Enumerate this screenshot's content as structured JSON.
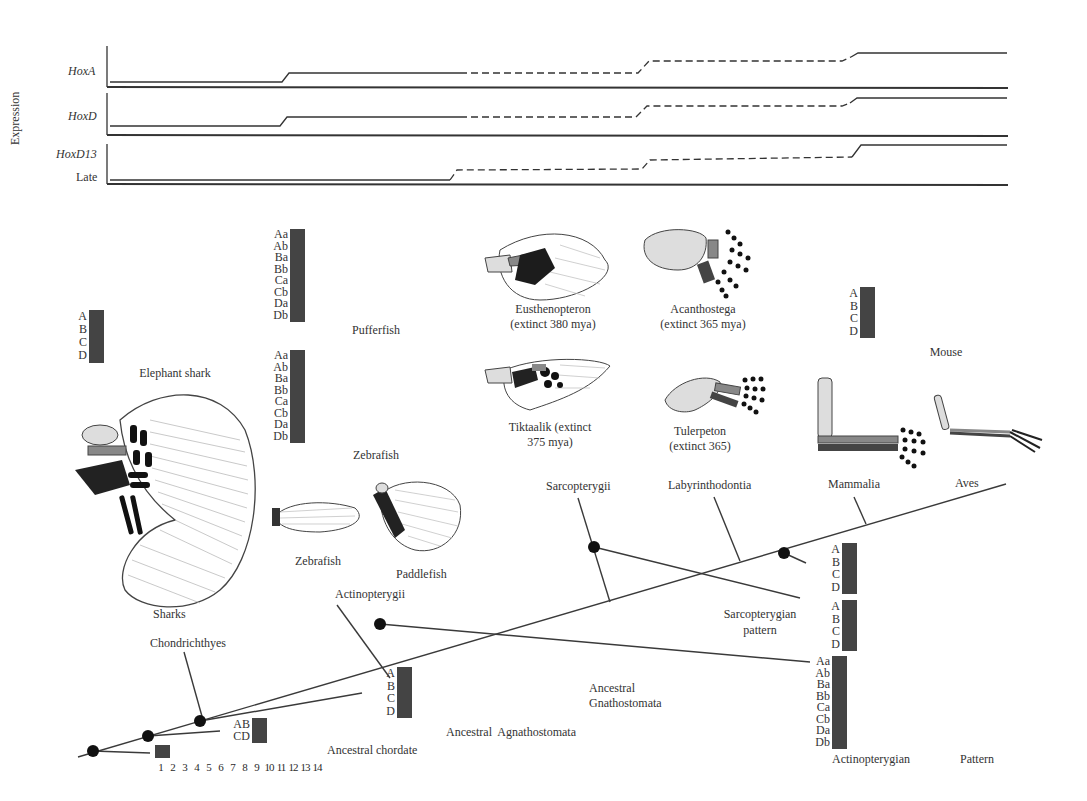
{
  "expression_panel": {
    "y_axis_label": "Expression",
    "tracks": [
      {
        "label": "HoxA",
        "italic": true
      },
      {
        "label": "HoxD",
        "italic": true
      },
      {
        "label": "HoxD13",
        "italic": true,
        "sublabel": "Late"
      }
    ]
  },
  "shade_colors": [
    "#ffffff",
    "#dcdcdc",
    "#999999",
    "#555555",
    "#1c1c1c"
  ],
  "grids": {
    "elephant_shark": {
      "caption": "Elephant shark",
      "rows": [
        "A",
        "B",
        "C",
        "D"
      ],
      "cells": [
        [
          3,
          4,
          4,
          1,
          4,
          2,
          3,
          0,
          2,
          1,
          3,
          0,
          3,
          0
        ],
        [
          3,
          4,
          4,
          1,
          4,
          2,
          3,
          3,
          2,
          1,
          0,
          0,
          3,
          0
        ],
        [
          3,
          0,
          4,
          1,
          4,
          2,
          0,
          3,
          2,
          1,
          3,
          2,
          3,
          0
        ],
        [
          3,
          0,
          4,
          0,
          4,
          0,
          0,
          3,
          2,
          1,
          3,
          2,
          2,
          1
        ]
      ]
    },
    "pufferfish": {
      "caption": "Pufferfish",
      "rows": [
        "Aa",
        "Ab",
        "Ba",
        "Bb",
        "Ca",
        "Cb",
        "Da",
        "Db"
      ],
      "cells": [
        [
          3,
          4,
          4,
          1,
          4,
          0,
          0,
          0,
          2,
          1,
          3,
          0,
          2,
          0
        ],
        [
          0,
          4,
          0,
          0,
          0,
          0,
          0,
          0,
          2,
          1,
          3,
          0,
          2,
          0
        ],
        [
          3,
          4,
          4,
          1,
          4,
          2,
          0,
          3,
          2,
          0,
          0,
          0,
          2,
          0
        ],
        [
          3,
          0,
          4,
          0,
          4,
          2,
          0,
          0,
          0,
          0,
          0,
          0,
          0,
          0
        ],
        [
          0,
          0,
          0,
          1,
          4,
          2,
          0,
          3,
          2,
          1,
          3,
          2,
          2,
          0
        ],
        [
          0,
          0,
          0,
          0,
          0,
          0,
          0,
          0,
          0,
          0,
          0,
          0,
          0,
          0
        ],
        [
          0,
          0,
          4,
          1,
          0,
          0,
          0,
          0,
          2,
          1,
          3,
          2,
          0,
          0
        ],
        [
          0,
          0,
          0,
          1,
          0,
          0,
          0,
          0,
          2,
          0,
          3,
          0,
          0,
          0
        ]
      ]
    },
    "zebrafish": {
      "caption": "Zebrafish",
      "rows": [
        "Aa",
        "Ab",
        "Ba",
        "Bb",
        "Ca",
        "Cb",
        "Da",
        "Db"
      ],
      "cells": [
        [
          3,
          0,
          4,
          1,
          4,
          0,
          0,
          0,
          2,
          1,
          3,
          0,
          2,
          0
        ],
        [
          0,
          4,
          0,
          0,
          0,
          0,
          0,
          0,
          2,
          1,
          3,
          0,
          2,
          0
        ],
        [
          3,
          4,
          4,
          1,
          4,
          2,
          3,
          3,
          2,
          1,
          0,
          0,
          0,
          0
        ],
        [
          3,
          0,
          0,
          0,
          4,
          2,
          0,
          3,
          0,
          0,
          0,
          0,
          0,
          0
        ],
        [
          3,
          0,
          4,
          1,
          4,
          0,
          3,
          3,
          2,
          1,
          3,
          0,
          2,
          0
        ],
        [
          0,
          0,
          0,
          0,
          0,
          2,
          0,
          0,
          0,
          0,
          3,
          2,
          2,
          0
        ],
        [
          0,
          0,
          4,
          1,
          0,
          0,
          0,
          3,
          2,
          1,
          3,
          2,
          2,
          0
        ],
        [
          0,
          0,
          0,
          0,
          0,
          0,
          0,
          0,
          0,
          0,
          0,
          0,
          0,
          0
        ]
      ]
    },
    "mouse": {
      "caption": "Mouse",
      "rows": [
        "A",
        "B",
        "C",
        "D"
      ],
      "cells": [
        [
          3,
          4,
          4,
          1,
          4,
          2,
          3,
          0,
          2,
          1,
          3,
          0,
          3,
          0
        ],
        [
          3,
          4,
          4,
          1,
          4,
          2,
          3,
          3,
          2,
          0,
          0,
          0,
          2,
          0
        ],
        [
          0,
          0,
          0,
          1,
          4,
          2,
          3,
          0,
          2,
          1,
          3,
          3,
          2,
          0
        ],
        [
          3,
          0,
          4,
          1,
          0,
          0,
          0,
          3,
          2,
          1,
          3,
          2,
          2,
          0
        ]
      ]
    },
    "ancestral_gnathostomata": {
      "caption": "Ancestral Gnathostomata",
      "rows": [
        "A",
        "B",
        "C",
        "D"
      ],
      "cells": [
        [
          3,
          4,
          4,
          1,
          4,
          2,
          3,
          0,
          2,
          1,
          3,
          0,
          3,
          1
        ],
        [
          3,
          4,
          4,
          1,
          4,
          2,
          3,
          3,
          2,
          1,
          0,
          0,
          3,
          1
        ],
        [
          3,
          0,
          4,
          1,
          4,
          2,
          0,
          3,
          2,
          1,
          3,
          3,
          3,
          0
        ],
        [
          3,
          4,
          4,
          1,
          4,
          0,
          0,
          3,
          2,
          1,
          3,
          3,
          3,
          1
        ]
      ]
    },
    "ancestral_agnathostomata": {
      "caption": "Ancestral  Agnathostomata",
      "rows": [
        "AB",
        "CD"
      ],
      "cells": [
        [
          3,
          4,
          4,
          1,
          4,
          2,
          3,
          3,
          2,
          1,
          3,
          0,
          2,
          1
        ],
        [
          3,
          0,
          4,
          1,
          4,
          2,
          0,
          3,
          2,
          1,
          3,
          3,
          2,
          1
        ]
      ]
    },
    "ancestral_chordate": {
      "caption": "Ancestral chordate",
      "cells": [
        [
          3,
          4,
          4,
          1,
          4,
          2,
          3,
          3,
          2,
          1,
          3,
          3,
          2,
          1
        ]
      ],
      "column_numbers": [
        "1",
        "2",
        "3",
        "4",
        "5",
        "6",
        "7",
        "8",
        "9",
        "10",
        "11",
        "12",
        "13",
        "14"
      ]
    },
    "tetrapod_pattern": {
      "rows": [
        "A",
        "B",
        "C",
        "D"
      ],
      "cells": [
        [
          3,
          4,
          4,
          1,
          4,
          2,
          3,
          0,
          2,
          1,
          3,
          0,
          3,
          0
        ],
        [
          3,
          4,
          4,
          1,
          4,
          2,
          3,
          3,
          2,
          0,
          0,
          0,
          2,
          0
        ],
        [
          0,
          0,
          0,
          1,
          4,
          2,
          3,
          0,
          2,
          1,
          3,
          3,
          2,
          0
        ],
        [
          3,
          0,
          4,
          1,
          0,
          0,
          0,
          3,
          2,
          1,
          3,
          3,
          2,
          0
        ]
      ]
    },
    "sarcopterygian_pattern": {
      "caption": "Sarcopterygian pattern",
      "rows": [
        "A",
        "B",
        "C",
        "D"
      ],
      "cells": [
        [
          3,
          4,
          4,
          1,
          4,
          0,
          0,
          0,
          2,
          1,
          3,
          0,
          3,
          1
        ],
        [
          3,
          4,
          4,
          1,
          4,
          2,
          3,
          3,
          2,
          1,
          0,
          0,
          2,
          0
        ],
        [
          3,
          0,
          4,
          1,
          4,
          2,
          0,
          3,
          2,
          1,
          3,
          3,
          2,
          0
        ],
        [
          0,
          0,
          4,
          1,
          0,
          0,
          0,
          3,
          2,
          1,
          3,
          3,
          2,
          0
        ]
      ]
    },
    "actinopterygian_pattern": {
      "caption_left": "Actinopterygian",
      "caption_right": "Pattern",
      "rows": [
        "Aa",
        "Ab",
        "Ba",
        "Bb",
        "Ca",
        "Cb",
        "Da",
        "Db"
      ],
      "cells": [
        [
          3,
          4,
          4,
          1,
          4,
          0,
          0,
          0,
          2,
          1,
          3,
          0,
          2,
          0
        ],
        [
          0,
          4,
          0,
          0,
          0,
          0,
          0,
          0,
          2,
          1,
          3,
          0,
          2,
          0
        ],
        [
          3,
          4,
          4,
          1,
          4,
          2,
          3,
          3,
          2,
          1,
          0,
          0,
          0,
          0
        ],
        [
          3,
          0,
          0,
          0,
          4,
          2,
          0,
          3,
          0,
          0,
          0,
          0,
          0,
          0
        ],
        [
          3,
          0,
          4,
          1,
          4,
          0,
          2,
          3,
          2,
          1,
          3,
          3,
          2,
          0
        ],
        [
          0,
          0,
          0,
          0,
          0,
          2,
          0,
          0,
          0,
          0,
          3,
          3,
          2,
          0
        ],
        [
          0,
          0,
          4,
          1,
          0,
          0,
          0,
          3,
          2,
          1,
          3,
          3,
          2,
          0
        ],
        [
          0,
          0,
          4,
          1,
          0,
          0,
          0,
          3,
          2,
          1,
          3,
          3,
          2,
          0
        ]
      ]
    }
  },
  "specimens": {
    "eusthenopteron": {
      "line1": "Eusthenopteron",
      "line2": "(extinct 380 mya)"
    },
    "acanthostega": {
      "line1": "Acanthostega",
      "line2": "(extinct 365 mya)"
    },
    "tiktaalik": {
      "line1": "Tiktaalik (extinct",
      "line2": "375 mya)"
    },
    "tulerpeton": {
      "line1": "Tulerpeton",
      "line2": "(extinct 365)"
    },
    "sharks": "Sharks",
    "zebrafish_fin": "Zebrafish",
    "paddlefish_fin": "Paddlefish"
  },
  "tree": {
    "clades": {
      "chondrichthyes": "Chondrichthyes",
      "actinopterygii": "Actinopterygii",
      "sarcopterygii": "Sarcopterygii",
      "labyrinthodontia": "Labyrinthodontia",
      "mammalia": "Mammalia",
      "aves": "Aves"
    }
  }
}
